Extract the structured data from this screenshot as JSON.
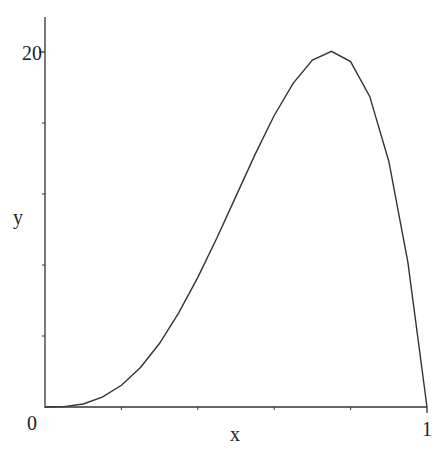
{
  "chart_data": {
    "type": "line",
    "title": "",
    "xlabel": "x",
    "ylabel": "y",
    "xlim": [
      0,
      1
    ],
    "ylim": [
      0,
      20
    ],
    "x_tick_labels": [
      "0",
      "1"
    ],
    "y_tick_labels": [
      "0",
      "20"
    ],
    "x_minor_ticks": [
      0.2,
      0.4,
      0.6,
      0.8
    ],
    "y_minor_ticks": [
      4,
      8,
      12,
      16
    ],
    "grid": false,
    "legend": null,
    "series": [
      {
        "name": "y",
        "x": [
          0,
          0.05,
          0.1,
          0.15,
          0.2,
          0.25,
          0.3,
          0.35,
          0.4,
          0.45,
          0.5,
          0.55,
          0.6,
          0.65,
          0.7,
          0.75,
          0.8,
          0.85,
          0.9,
          0.95,
          1.0
        ],
        "values": [
          0,
          0.02,
          0.17,
          0.55,
          1.22,
          2.23,
          3.59,
          5.3,
          7.3,
          9.52,
          11.88,
          14.23,
          16.42,
          18.25,
          19.55,
          20.04,
          19.46,
          17.5,
          13.85,
          8.15,
          0
        ]
      }
    ],
    "color": "#333333"
  }
}
